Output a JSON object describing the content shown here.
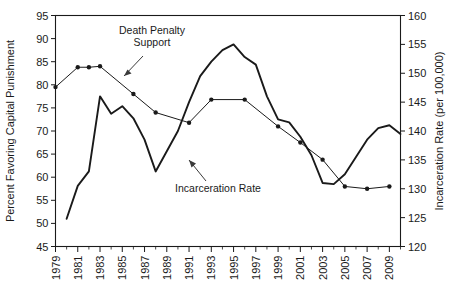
{
  "chart_data": {
    "type": "line",
    "title": "",
    "xlabel": "",
    "ylabel": "Percent Favoring Capital Punishment",
    "y2label": "Incarceration Rate (per 100,000)",
    "xlim": [
      1979,
      2010
    ],
    "ylim": [
      45,
      95
    ],
    "y2lim": [
      120,
      160
    ],
    "grid": false,
    "legend": "none (inline annotations with arrows)",
    "xticks": [
      1979,
      1981,
      1983,
      1985,
      1987,
      1989,
      1991,
      1993,
      1995,
      1997,
      1999,
      2001,
      2003,
      2005,
      2007,
      2009
    ],
    "xtick_labels": [
      "1979",
      "1981",
      "1983",
      "1985",
      "1987",
      "1989",
      "1991",
      "1993",
      "1995",
      "1997",
      "1999",
      "2001",
      "2003",
      "2005",
      "2007",
      "2009"
    ],
    "xminor_every_year": true,
    "yticks": [
      45,
      50,
      55,
      60,
      65,
      70,
      75,
      80,
      85,
      90,
      95
    ],
    "ytick_labels": [
      "45",
      "50",
      "55",
      "60",
      "65",
      "70",
      "75",
      "80",
      "85",
      "90",
      "95"
    ],
    "y2ticks": [
      120,
      125,
      130,
      135,
      140,
      145,
      150,
      155,
      160
    ],
    "y2tick_labels": [
      "120",
      "125",
      "130",
      "135",
      "140",
      "145",
      "150",
      "155",
      "160"
    ],
    "annotations": [
      {
        "text": "Death Penalty Support",
        "lines": [
          "Death Penalty",
          "Support"
        ],
        "arrow_to_series": "death_penalty_support"
      },
      {
        "text": "Incarceration Rate",
        "lines": [
          "Incarceration Rate"
        ],
        "arrow_to_series": "incarceration_rate"
      }
    ],
    "series": [
      {
        "name": "Death Penalty Support",
        "axis": "left",
        "units": "percent favoring capital punishment",
        "markers": "filled circle",
        "x": [
          1979,
          1981,
          1982,
          1983,
          1986,
          1988,
          1991,
          1993,
          1996,
          1999,
          2001,
          2003,
          2005,
          2007,
          2009
        ],
        "values": [
          79.5,
          83.8,
          83.8,
          84.0,
          78.0,
          74.0,
          71.8,
          76.8,
          76.8,
          71.0,
          67.5,
          63.8,
          58.0,
          57.5,
          58.0
        ],
        "y_right_equivalent": [
          146.0,
          149.4,
          149.4,
          149.6,
          144.8,
          141.6,
          139.8,
          143.8,
          143.8,
          139.2,
          136.4,
          133.4,
          128.8,
          128.4,
          128.8
        ]
      },
      {
        "name": "Incarceration Rate",
        "axis": "right",
        "units": "per 100,000",
        "markers": "none",
        "x": [
          1980,
          1981,
          1982,
          1983,
          1984,
          1985,
          1986,
          1987,
          1988,
          1989,
          1990,
          1991,
          1992,
          1993,
          1994,
          1995,
          1996,
          1997,
          1998,
          1999,
          2000,
          2001,
          2002,
          2003,
          2004,
          2005,
          2006,
          2007,
          2008,
          2009,
          2010
        ],
        "values_right_axis": [
          124.8,
          130.5,
          133.0,
          146.0,
          143.0,
          144.3,
          142.2,
          138.5,
          133.0,
          136.5,
          140.0,
          145.0,
          149.5,
          152.0,
          154.0,
          155.0,
          152.8,
          151.5,
          146.0,
          142.0,
          141.5,
          139.0,
          135.8,
          131.0,
          130.8,
          132.5,
          135.5,
          138.5,
          140.5,
          141.0,
          139.5
        ],
        "values_left_equivalent": [
          50.5,
          57.0,
          60.0,
          79.5,
          75.8,
          77.5,
          74.8,
          70.0,
          63.0,
          67.5,
          72.0,
          78.0,
          83.5,
          86.5,
          89.0,
          90.0,
          87.0,
          85.5,
          79.5,
          74.5,
          74.0,
          71.0,
          66.8,
          60.5,
          60.2,
          62.5,
          66.5,
          70.0,
          72.5,
          73.0,
          71.5
        ]
      }
    ]
  }
}
